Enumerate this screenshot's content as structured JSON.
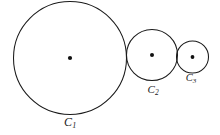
{
  "figure": {
    "background_color": "#ffffff",
    "stroke_color": "#1a1a1a",
    "dot_color": "#111111",
    "label_color": "#1c1c1c",
    "width": 220,
    "height": 135
  },
  "chart_data": {
    "type": "diagram",
    "subtype": "geometric-circle-chain",
    "title": "",
    "xlabel": "",
    "ylabel": "",
    "grid": false,
    "legend": null,
    "shapes": [
      {
        "id": "C1",
        "shape": "circle",
        "cx": 70,
        "cy": 58,
        "r": 56.5,
        "label": "C",
        "subscript": "1",
        "label_x": 70,
        "label_y": 122,
        "has_center_dot": true
      },
      {
        "id": "C2",
        "shape": "circle",
        "cx": 152,
        "cy": 55,
        "r": 25.5,
        "label": "C",
        "subscript": "2",
        "label_x": 153,
        "label_y": 90,
        "has_center_dot": true
      },
      {
        "id": "C3",
        "shape": "circle",
        "cx": 192.5,
        "cy": 57,
        "r": 16,
        "label": "C",
        "subscript": "3",
        "label_x": 191,
        "label_y": 79,
        "has_center_dot": true
      }
    ],
    "tangencies": [
      {
        "between": [
          "C1",
          "C2"
        ],
        "point_x": 126.5,
        "point_y": 56.9
      },
      {
        "between": [
          "C2",
          "C3"
        ],
        "point_x": 177.5,
        "point_y": 55.8
      }
    ]
  },
  "labels": {
    "c1": {
      "base": "C",
      "sub": "1"
    },
    "c2": {
      "base": "C",
      "sub": "2"
    },
    "c3": {
      "base": "C",
      "sub": "3"
    }
  }
}
